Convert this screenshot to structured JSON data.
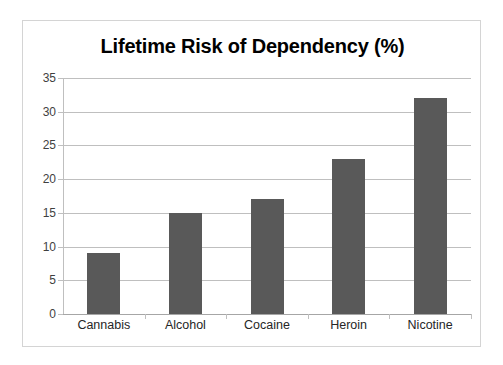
{
  "chart_data": {
    "type": "bar",
    "title": "Lifetime Risk of Dependency (%)",
    "xlabel": "",
    "ylabel": "",
    "categories": [
      "Cannabis",
      "Alcohol",
      "Cocaine",
      "Heroin",
      "Nicotine"
    ],
    "values": [
      9,
      15,
      17,
      23,
      32
    ],
    "ylim": [
      0,
      35
    ],
    "ytick_step": 5,
    "ytick_labels": [
      "0",
      "5",
      "10",
      "15",
      "20",
      "25",
      "30",
      "35"
    ],
    "ytick_values": [
      0,
      5,
      10,
      15,
      20,
      25,
      30,
      35
    ],
    "grid": true,
    "legend": false,
    "legend_position": "none",
    "bar_color": "#595959",
    "gridline_color": "#bfbfbf",
    "axis_color": "#bfbfbf",
    "title_color": "#000000",
    "tick_label_color": "#3f3f3f",
    "category_label_color": "#262626",
    "background_color": "#ffffff",
    "frame_border_color": "#d4d4d4"
  }
}
